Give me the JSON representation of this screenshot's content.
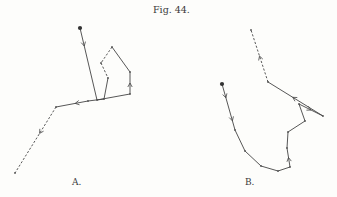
{
  "figure": {
    "title": "Fig. 44.",
    "panels": [
      {
        "id": "A",
        "label": "A.",
        "description": "Trajectory path A with direction arrows",
        "path": [
          {
            "x": 80,
            "y": 28,
            "start": true
          },
          {
            "x": 97,
            "y": 100
          },
          {
            "x": 130,
            "y": 94
          },
          {
            "x": 130,
            "y": 72
          },
          {
            "x": 112,
            "y": 47
          },
          {
            "x": 101,
            "y": 63,
            "style": "dashed"
          },
          {
            "x": 108,
            "y": 78,
            "style": "dashed"
          },
          {
            "x": 104,
            "y": 99
          },
          {
            "x": 88,
            "y": 101
          },
          {
            "x": 56,
            "y": 107,
            "style": "solid"
          },
          {
            "x": 15,
            "y": 173,
            "style": "dashed"
          }
        ],
        "arrows": [
          {
            "at": 0,
            "t": 0.25
          },
          {
            "at": 2,
            "t": 0.5
          },
          {
            "at": 8,
            "t": 0.4
          },
          {
            "at": 9,
            "t": 0.4
          }
        ]
      },
      {
        "id": "B",
        "label": "B.",
        "description": "Trajectory path B with direction arrows",
        "path": [
          {
            "x": 222,
            "y": 84,
            "start": true
          },
          {
            "x": 235,
            "y": 130
          },
          {
            "x": 245,
            "y": 151
          },
          {
            "x": 261,
            "y": 166
          },
          {
            "x": 278,
            "y": 171
          },
          {
            "x": 290,
            "y": 167
          },
          {
            "x": 287,
            "y": 148
          },
          {
            "x": 288,
            "y": 132
          },
          {
            "x": 305,
            "y": 121
          },
          {
            "x": 299,
            "y": 104
          },
          {
            "x": 323,
            "y": 116
          },
          {
            "x": 268,
            "y": 82
          },
          {
            "x": 251,
            "y": 30,
            "style": "dashed"
          }
        ],
        "arrows": [
          {
            "at": 0,
            "t": 0.3
          },
          {
            "at": 0,
            "t": 0.8
          },
          {
            "at": 5,
            "t": 0.5
          },
          {
            "at": 9,
            "t": 0.5
          },
          {
            "at": 10,
            "t": 0.55
          },
          {
            "at": 11,
            "t": 0.5
          }
        ]
      }
    ]
  }
}
